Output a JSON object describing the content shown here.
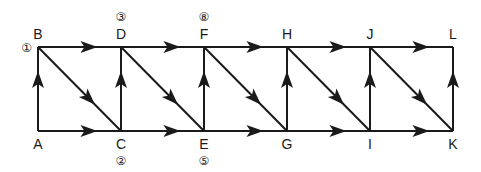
{
  "diagram": {
    "type": "directed-graph",
    "nodes": [
      {
        "id": "A",
        "row": "bottom",
        "col": 0
      },
      {
        "id": "B",
        "row": "top",
        "col": 0,
        "order": "①"
      },
      {
        "id": "C",
        "row": "bottom",
        "col": 1,
        "order": "②"
      },
      {
        "id": "D",
        "row": "top",
        "col": 1,
        "order": "③"
      },
      {
        "id": "E",
        "row": "bottom",
        "col": 2,
        "order": "⑤"
      },
      {
        "id": "F",
        "row": "top",
        "col": 2,
        "order": "⑧"
      },
      {
        "id": "G",
        "row": "bottom",
        "col": 3
      },
      {
        "id": "H",
        "row": "top",
        "col": 3
      },
      {
        "id": "I",
        "row": "bottom",
        "col": 4
      },
      {
        "id": "J",
        "row": "top",
        "col": 4
      },
      {
        "id": "K",
        "row": "bottom",
        "col": 5
      },
      {
        "id": "L",
        "row": "top",
        "col": 5
      }
    ],
    "edges": [
      {
        "from": "A",
        "to": "B",
        "arrow": true
      },
      {
        "from": "A",
        "to": "C",
        "arrow": true
      },
      {
        "from": "B",
        "to": "D",
        "arrow": true
      },
      {
        "from": "B",
        "to": "C",
        "arrow": true
      },
      {
        "from": "C",
        "to": "D",
        "arrow": true
      },
      {
        "from": "C",
        "to": "E",
        "arrow": true
      },
      {
        "from": "D",
        "to": "F",
        "arrow": true
      },
      {
        "from": "D",
        "to": "E",
        "arrow": true
      },
      {
        "from": "E",
        "to": "F",
        "arrow": true
      },
      {
        "from": "E",
        "to": "G",
        "arrow": true
      },
      {
        "from": "F",
        "to": "H",
        "arrow": true
      },
      {
        "from": "F",
        "to": "G",
        "arrow": true
      },
      {
        "from": "G",
        "to": "H",
        "arrow": true
      },
      {
        "from": "G",
        "to": "I",
        "arrow": true
      },
      {
        "from": "H",
        "to": "J",
        "arrow": true
      },
      {
        "from": "H",
        "to": "I",
        "arrow": true
      },
      {
        "from": "I",
        "to": "J",
        "arrow": true
      },
      {
        "from": "I",
        "to": "K",
        "arrow": true
      },
      {
        "from": "J",
        "to": "L",
        "arrow": true
      },
      {
        "from": "J",
        "to": "K",
        "arrow": true
      },
      {
        "from": "K",
        "to": "L",
        "arrow": true
      }
    ]
  }
}
